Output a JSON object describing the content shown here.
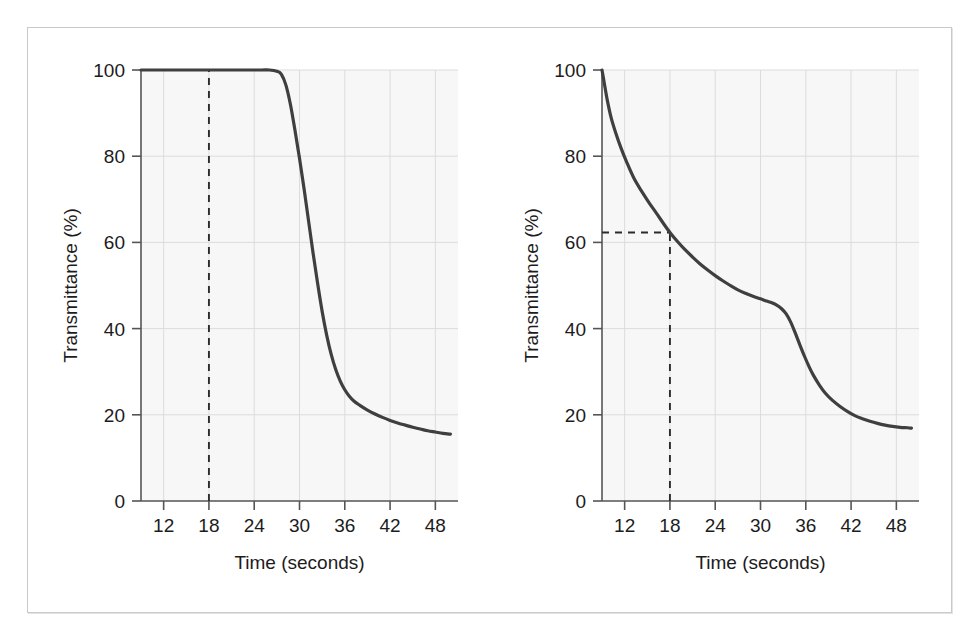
{
  "figure": {
    "background_color": "#ffffff",
    "frame_border_color": "#c9c9c9",
    "plot_background_color": "#f7f7f7",
    "grid_color": "#dcdcdc",
    "axis_color": "#555555",
    "curve_color": "#3f3f3f",
    "guide_color": "#2b2b2b"
  },
  "chart_data": [
    {
      "type": "line",
      "panel": "left",
      "title": "",
      "xlabel": "Time (seconds)",
      "ylabel": "Transmittance (%)",
      "xlim": [
        9,
        51
      ],
      "ylim": [
        0,
        100
      ],
      "xticks": [
        12,
        18,
        24,
        30,
        36,
        42,
        48
      ],
      "xticklabels": [
        "12",
        "18",
        "24",
        "30",
        "36",
        "42",
        "48"
      ],
      "yticks": [
        0,
        20,
        40,
        60,
        80,
        100
      ],
      "yticklabels": [
        "0",
        "20",
        "40",
        "60",
        "80",
        "100"
      ],
      "grid": true,
      "legend": "none",
      "series": [
        {
          "name": "transmittance",
          "x": [
            9,
            11,
            13,
            15,
            17,
            19,
            21,
            23,
            25,
            26,
            27,
            27.6,
            28.2,
            28.8,
            29.4,
            30,
            30.6,
            31.2,
            31.8,
            32.4,
            33,
            33.6,
            34.2,
            34.8,
            35.4,
            36,
            36.6,
            37.2,
            38,
            39,
            40,
            41,
            42,
            43,
            44,
            45,
            46,
            47,
            48,
            49,
            50
          ],
          "y": [
            100,
            100,
            100,
            100,
            100,
            100,
            100,
            100,
            100,
            100,
            99.7,
            99,
            96.5,
            92,
            86,
            79.5,
            72.5,
            65,
            57.5,
            50.5,
            44,
            38.5,
            34,
            30.5,
            27.8,
            25.8,
            24.3,
            23.2,
            22.2,
            21.1,
            20.2,
            19.4,
            18.7,
            18.1,
            17.6,
            17.1,
            16.7,
            16.3,
            16,
            15.7,
            15.5
          ]
        }
      ],
      "annotations": [
        {
          "kind": "vertical-dashed-line",
          "x": 18,
          "y_from": 0,
          "y_to": 100,
          "label": ""
        }
      ]
    },
    {
      "type": "line",
      "panel": "right",
      "title": "",
      "xlabel": "Time (seconds)",
      "ylabel": "Transmittance (%)",
      "xlim": [
        9,
        51
      ],
      "ylim": [
        0,
        100
      ],
      "xticks": [
        12,
        18,
        24,
        30,
        36,
        42,
        48
      ],
      "xticklabels": [
        "12",
        "18",
        "24",
        "30",
        "36",
        "42",
        "48"
      ],
      "yticks": [
        0,
        20,
        40,
        60,
        80,
        100
      ],
      "yticklabels": [
        "0",
        "20",
        "40",
        "60",
        "80",
        "100"
      ],
      "grid": true,
      "legend": "none",
      "series": [
        {
          "name": "transmittance",
          "x": [
            9,
            9.3,
            9.7,
            10.2,
            10.8,
            11.5,
            12.3,
            13.2,
            14.2,
            15.2,
            16.2,
            17.1,
            18,
            19,
            20,
            21,
            22,
            23,
            24,
            25,
            26,
            27,
            28,
            29,
            30,
            30.8,
            31.5,
            32.2,
            32.8,
            33.4,
            34,
            34.6,
            35.2,
            35.8,
            36.4,
            37,
            37.8,
            38.6,
            39.5,
            40.5,
            41.5,
            42.5,
            43.5,
            44.5,
            45.5,
            46.5,
            47.5,
            48.5,
            49.5,
            50
          ],
          "y": [
            100,
            97,
            93,
            89,
            85.5,
            82,
            78.5,
            75,
            72,
            69.3,
            66.8,
            64.5,
            62.3,
            60.2,
            58.3,
            56.6,
            55,
            53.6,
            52.3,
            51.1,
            50,
            49,
            48.2,
            47.5,
            46.9,
            46.4,
            46,
            45.4,
            44.6,
            43.4,
            41.5,
            39,
            36.3,
            33.7,
            31.3,
            29.2,
            26.9,
            25,
            23.4,
            22,
            20.8,
            19.8,
            19.1,
            18.5,
            18,
            17.6,
            17.3,
            17.1,
            17,
            16.9
          ]
        }
      ],
      "annotations": [
        {
          "kind": "vertical-dashed-line",
          "x": 18,
          "y_from": 0,
          "y_to": 62.3,
          "label": ""
        },
        {
          "kind": "horizontal-dashed-line",
          "y": 62.3,
          "x_from": 9,
          "x_to": 18,
          "label": ""
        }
      ]
    }
  ]
}
